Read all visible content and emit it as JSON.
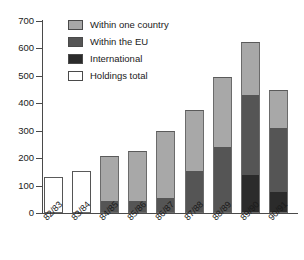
{
  "chart_data": {
    "type": "bar",
    "subtype": "stacked-bar",
    "title": "",
    "subtitle": "",
    "xlabel": "",
    "ylabel": "",
    "ylim": [
      0,
      700
    ],
    "yticks": [
      0,
      100,
      200,
      300,
      400,
      500,
      600,
      700
    ],
    "ytick_labels": [
      "0",
      "100",
      "200",
      "300",
      "400",
      "500",
      "600",
      "700"
    ],
    "grid": false,
    "legend_position": "top-left-inside",
    "categories": [
      "82/83",
      "83/84",
      "84/85",
      "85/86",
      "86/87",
      "87/88",
      "88/89",
      "89/90",
      "90/91"
    ],
    "series": [
      {
        "name": "Within one country",
        "color": "#a8a8a8",
        "values": [
          null,
          null,
          166,
          182,
          245,
          220,
          255,
          195,
          140
        ]
      },
      {
        "name": "Within the EU",
        "color": "#555555",
        "values": [
          null,
          null,
          42,
          45,
          55,
          155,
          240,
          290,
          235
        ]
      },
      {
        "name": "International",
        "color": "#2b2b2b",
        "values": [
          null,
          null,
          0,
          0,
          0,
          0,
          0,
          140,
          75
        ]
      },
      {
        "name": "Holdings total",
        "color": "#ffffff",
        "values": [
          132,
          152,
          null,
          null,
          null,
          null,
          null,
          null,
          null
        ]
      }
    ],
    "totals": [
      132,
      152,
      208,
      227,
      300,
      375,
      495,
      625,
      450
    ]
  },
  "legend": {
    "items": [
      {
        "label": "Within one country",
        "swatch": "#a8a8a8"
      },
      {
        "label": "Within the EU",
        "swatch": "#555555"
      },
      {
        "label": "International",
        "swatch": "#2b2b2b"
      },
      {
        "label": "Holdings total",
        "swatch": "#ffffff"
      }
    ]
  }
}
